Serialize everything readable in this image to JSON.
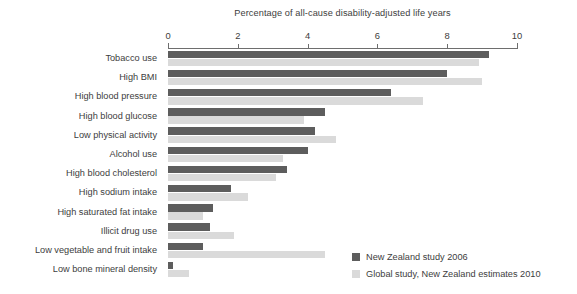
{
  "chart_data": {
    "type": "bar",
    "orientation": "horizontal",
    "title": "Percentage of all-cause disability-adjusted life years",
    "xlabel": "",
    "ylabel": "",
    "xlim": [
      0,
      10
    ],
    "xticks": [
      0,
      2,
      4,
      6,
      8,
      10
    ],
    "xtick_labels": [
      "0",
      "2",
      "4",
      "6",
      "8",
      "10"
    ],
    "grid": false,
    "legend_position": "bottom-right",
    "categories": [
      "Tobacco use",
      "High BMI",
      "High blood pressure",
      "High blood glucose",
      "Low physical activity",
      "Alcohol use",
      "High blood cholesterol",
      "High sodium intake",
      "High saturated fat intake",
      "Illicit drug use",
      "Low vegetable and fruit intake",
      "Low bone mineral density"
    ],
    "series": [
      {
        "name": "New Zealand study 2006",
        "color": "#5d5d5d",
        "values": [
          9.2,
          8.0,
          6.4,
          4.5,
          4.2,
          4.0,
          3.4,
          1.8,
          1.3,
          1.2,
          1.0,
          0.15
        ]
      },
      {
        "name": "Global study, New Zealand estimates 2010",
        "color": "#dadada",
        "values": [
          8.9,
          9.0,
          7.3,
          3.9,
          4.8,
          3.3,
          3.1,
          2.3,
          1.0,
          1.9,
          4.5,
          0.6
        ]
      }
    ]
  }
}
